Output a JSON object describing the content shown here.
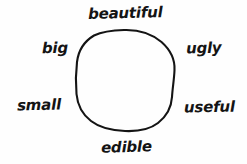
{
  "diagram": {
    "kind": "hand-drawn word association circle",
    "background_color": "#fefefe",
    "ink_color": "#141414",
    "shape": {
      "name": "circle",
      "style": "hand-drawn irregular outline",
      "center_x": 125,
      "center_y": 80,
      "radius_x": 49,
      "radius_y": 50,
      "stroke_width": 2.1,
      "filled": false
    },
    "labels": [
      {
        "id": "beautiful",
        "text": "beautiful",
        "position": "top"
      },
      {
        "id": "ugly",
        "text": "ugly",
        "position": "upper-right"
      },
      {
        "id": "useful",
        "text": "useful",
        "position": "lower-right"
      },
      {
        "id": "edible",
        "text": "edible",
        "position": "bottom"
      },
      {
        "id": "small",
        "text": "small",
        "position": "lower-left"
      },
      {
        "id": "big",
        "text": "big",
        "position": "upper-left"
      }
    ]
  }
}
